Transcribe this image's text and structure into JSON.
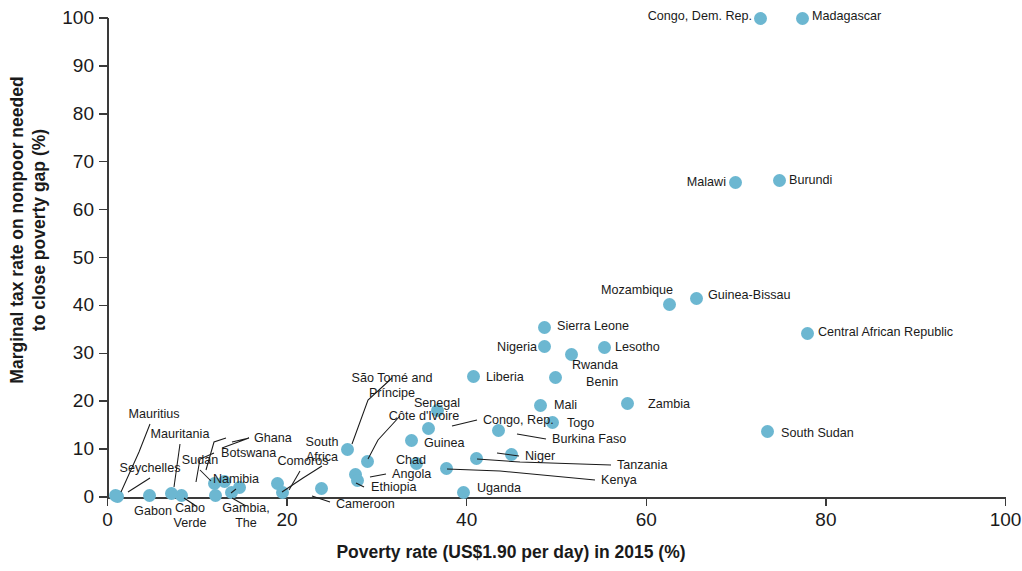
{
  "chart_data": {
    "type": "scatter",
    "title": "",
    "xlabel": "Poverty rate (US$1.90 per day) in 2015 (%)",
    "ylabel": "Marginal tax rate on nonpoor needed\nto close poverty gap (%)",
    "ylabel_line1": "Marginal tax rate on nonpoor needed",
    "ylabel_line2": "to close poverty gap (%)",
    "xlim": [
      0,
      100
    ],
    "ylim": [
      0,
      100
    ],
    "xticks": [
      0,
      20,
      40,
      60,
      80,
      100
    ],
    "yticks": [
      0,
      10,
      20,
      30,
      40,
      50,
      60,
      70,
      80,
      90,
      100
    ],
    "grid": false,
    "legend": "none",
    "marker_color": "#6cb7d1",
    "points": [
      {
        "name": "Congo, Dem. Rep.",
        "x": 72.7,
        "y": 100.0,
        "label_pos": "left"
      },
      {
        "name": "Madagascar",
        "x": 77.4,
        "y": 100.0,
        "label_pos": "right"
      },
      {
        "name": "Burundi",
        "x": 74.8,
        "y": 66.0,
        "label_pos": "right"
      },
      {
        "name": "Malawi",
        "x": 69.9,
        "y": 65.6,
        "label_pos": "left"
      },
      {
        "name": "Guinea-Bissau",
        "x": 65.6,
        "y": 41.4,
        "label_pos": "right"
      },
      {
        "name": "Mozambique",
        "x": 62.6,
        "y": 40.1,
        "label_pos": "above"
      },
      {
        "name": "Central African Republic",
        "x": 77.9,
        "y": 34.2,
        "label_pos": "right"
      },
      {
        "name": "Sierra Leone",
        "x": 48.7,
        "y": 35.4,
        "label_pos": "right"
      },
      {
        "name": "Nigeria",
        "x": 48.7,
        "y": 31.4,
        "label_pos": "left"
      },
      {
        "name": "Lesotho",
        "x": 55.3,
        "y": 31.3,
        "label_pos": "right"
      },
      {
        "name": "Rwanda",
        "x": 51.7,
        "y": 29.8,
        "label_pos": "below"
      },
      {
        "name": "Liberia",
        "x": 40.8,
        "y": 25.2,
        "label_pos": "right"
      },
      {
        "name": "Benin",
        "x": 49.9,
        "y": 25.0,
        "label_pos": "right"
      },
      {
        "name": "Mali",
        "x": 48.2,
        "y": 19.1,
        "label_pos": "right"
      },
      {
        "name": "Zambia",
        "x": 57.9,
        "y": 19.5,
        "label_pos": "right"
      },
      {
        "name": "Togo",
        "x": 49.6,
        "y": 15.6,
        "label_pos": "right"
      },
      {
        "name": "Senegal",
        "x": 36.7,
        "y": 18.1,
        "label_pos": "above"
      },
      {
        "name": "Congo, Rep.",
        "x": 35.8,
        "y": 14.2,
        "label_pos": "leader-right"
      },
      {
        "name": "Burkina Faso",
        "x": 43.5,
        "y": 13.8,
        "label_pos": "right"
      },
      {
        "name": "South Sudan",
        "x": 73.5,
        "y": 13.6,
        "label_pos": "right"
      },
      {
        "name": "Guinea",
        "x": 33.8,
        "y": 11.7,
        "label_pos": "right"
      },
      {
        "name": "São Tomé and Príncipe",
        "x": 26.7,
        "y": 9.9,
        "label_pos": "leader-above"
      },
      {
        "name": "Niger",
        "x": 45.0,
        "y": 8.8,
        "label_pos": "right"
      },
      {
        "name": "Côte d'Ivoire",
        "x": 28.9,
        "y": 7.5,
        "label_pos": "leader-above"
      },
      {
        "name": "Chad",
        "x": 34.4,
        "y": 6.9,
        "label_pos": "right"
      },
      {
        "name": "Tanzania",
        "x": 41.1,
        "y": 8.1,
        "label_pos": "leader-right"
      },
      {
        "name": "Kenya",
        "x": 37.8,
        "y": 6.0,
        "label_pos": "leader-right"
      },
      {
        "name": "Angola",
        "x": 27.6,
        "y": 4.8,
        "label_pos": "leader-right"
      },
      {
        "name": "Ethiopia",
        "x": 27.8,
        "y": 3.4,
        "label_pos": "leader-right"
      },
      {
        "name": "South Africa",
        "x": 18.9,
        "y": 2.9,
        "label_pos": "leader-above"
      },
      {
        "name": "Comoros",
        "x": 19.5,
        "y": 1.0,
        "label_pos": "leader-above"
      },
      {
        "name": "Cameroon",
        "x": 23.8,
        "y": 1.8,
        "label_pos": "leader-right"
      },
      {
        "name": "Uganda",
        "x": 39.6,
        "y": 0.9,
        "label_pos": "right"
      },
      {
        "name": "Ghana",
        "x": 13.0,
        "y": 3.3,
        "label_pos": "leader-above"
      },
      {
        "name": "Botswana",
        "x": 14.7,
        "y": 1.9,
        "label_pos": "leader-above"
      },
      {
        "name": "Namibia",
        "x": 13.8,
        "y": 1.0,
        "label_pos": "leader-above"
      },
      {
        "name": "Sudan",
        "x": 11.9,
        "y": 2.9,
        "label_pos": "leader-above"
      },
      {
        "name": "Gambia, The",
        "x": 12.0,
        "y": 0.3,
        "label_pos": "leader-below"
      },
      {
        "name": "Cabo Verde",
        "x": 8.2,
        "y": 0.4,
        "label_pos": "leader-below"
      },
      {
        "name": "Mauritania",
        "x": 7.1,
        "y": 0.8,
        "label_pos": "leader-above"
      },
      {
        "name": "Gabon",
        "x": 4.7,
        "y": 0.4,
        "label_pos": "below"
      },
      {
        "name": "Mauritius",
        "x": 0.9,
        "y": 0.4,
        "label_pos": "leader-above"
      },
      {
        "name": "Seychelles",
        "x": 1.1,
        "y": 0.2,
        "label_pos": "leader-above"
      }
    ]
  },
  "labels": {
    "congo_dem_rep": "Congo, Dem. Rep.",
    "madagascar": "Madagascar",
    "malawi": "Malawi",
    "burundi": "Burundi",
    "mozambique": "Mozambique",
    "guinea_bissau": "Guinea-Bissau",
    "central_african_republic": "Central African Republic",
    "sierra_leone": "Sierra Leone",
    "nigeria": "Nigeria",
    "lesotho": "Lesotho",
    "rwanda": "Rwanda",
    "liberia": "Liberia",
    "benin": "Benin",
    "mali": "Mali",
    "zambia": "Zambia",
    "togo": "Togo",
    "senegal": "Senegal",
    "congo_rep": "Congo, Rep.",
    "burkina_faso": "Burkina Faso",
    "south_sudan": "South Sudan",
    "guinea": "Guinea",
    "sao_tome_1": "São Tomé and",
    "sao_tome_2": "Príncipe",
    "niger": "Niger",
    "cote_divoire": "Côte d'Ivoire",
    "chad": "Chad",
    "tanzania": "Tanzania",
    "kenya": "Kenya",
    "angola": "Angola",
    "ethiopia": "Ethiopia",
    "south_africa_1": "South",
    "south_africa_2": "Africa",
    "comoros": "Comoros",
    "cameroon": "Cameroon",
    "uganda": "Uganda",
    "ghana": "Ghana",
    "botswana": "Botswana",
    "namibia": "Namibia",
    "sudan": "Sudan",
    "gambia_1": "Gambia,",
    "gambia_2": "The",
    "cabo_verde_1": "Cabo",
    "cabo_verde_2": "Verde",
    "mauritania": "Mauritania",
    "gabon": "Gabon",
    "mauritius": "Mauritius",
    "seychelles": "Seychelles"
  },
  "ticks": {
    "x": [
      "0",
      "20",
      "40",
      "60",
      "80",
      "100"
    ],
    "y": [
      "0",
      "10",
      "20",
      "30",
      "40",
      "50",
      "60",
      "70",
      "80",
      "90",
      "100"
    ]
  },
  "axis_titles": {
    "x": "Poverty rate (US$1.90 per day) in 2015 (%)",
    "y_line1": "Marginal tax rate on nonpoor needed",
    "y_line2": "to close poverty gap (%)"
  }
}
